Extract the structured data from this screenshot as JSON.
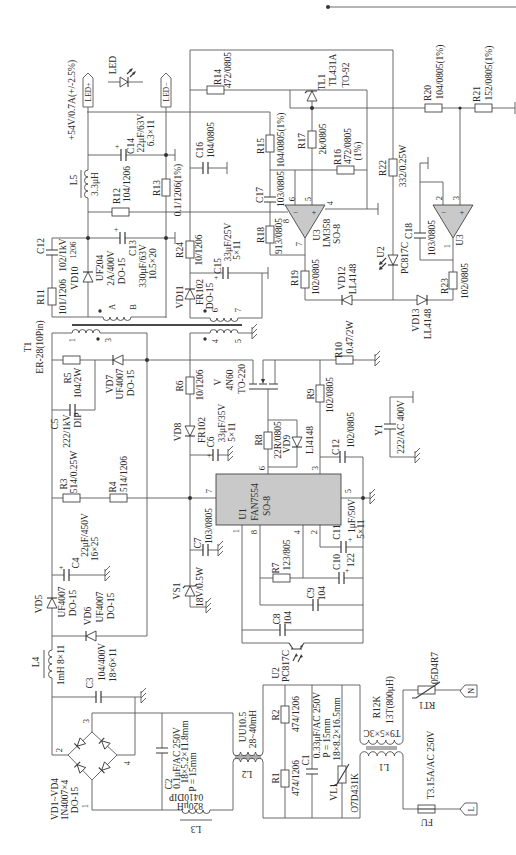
{
  "output": {
    "voltage_spec": "+54V/0.7A(+/-2.5%)",
    "led_plus": "LED+",
    "led_minus": "LED−",
    "led": "LED"
  },
  "components": {
    "R14": {
      "ref": "R14",
      "value": "472/0805"
    },
    "TL1": {
      "ref": "TL1",
      "part": "TL431A",
      "package": "TO-92"
    },
    "R20": {
      "ref": "R20",
      "value": "104/0805(1%)"
    },
    "R21": {
      "ref": "R21",
      "value": "152/0805(1%)"
    },
    "C14": {
      "ref": "C14",
      "value": "22μF/63V",
      "size": "6.3×11",
      "polarity": "+"
    },
    "C16": {
      "ref": "C16",
      "value": "104/0805"
    },
    "L5": {
      "ref": "L5",
      "value": "3.3μH"
    },
    "R12": {
      "ref": "R12",
      "value": "104/1206"
    },
    "R13": {
      "ref": "R13",
      "value": "0.1/1206(1%)"
    },
    "R15": {
      "ref": "R15",
      "value": "104/0805(1%)"
    },
    "R17": {
      "ref": "R17",
      "value": "2k/0805"
    },
    "R16": {
      "ref": "R16",
      "value": "472/0805",
      "tolerance": "(1%)"
    },
    "R22": {
      "ref": "R22",
      "value": "332/0.25W"
    },
    "C17": {
      "ref": "C17",
      "value": "103/0805"
    },
    "U3A": {
      "ref": "U3",
      "part": "LM358",
      "package": "SO-8",
      "minus": "−",
      "plus": "+",
      "pins": {
        "p4": "4",
        "p5": "5",
        "p6": "6",
        "p7": "7",
        "p8": "8"
      }
    },
    "U3B": {
      "ref": "U3",
      "minus": "−",
      "plus": "+",
      "pins": {
        "p1": "1",
        "p2": "2",
        "p3": "3"
      }
    },
    "R18": {
      "ref": "R18",
      "value": "913/0805"
    },
    "R19": {
      "ref": "R19",
      "value": "102/0805"
    },
    "VD12": {
      "ref": "VD12",
      "part": "LL4148"
    },
    "VD13": {
      "ref": "VD13",
      "part": "LL4148"
    },
    "U2A": {
      "ref": "U2",
      "part": "PC817C"
    },
    "C18": {
      "ref": "C18",
      "value": "103/0805"
    },
    "R23": {
      "ref": "R23",
      "value": "102/0805"
    },
    "R10": {
      "ref": "R10",
      "value": "0.47/2W"
    },
    "R24": {
      "ref": "R24",
      "value": "10/1206"
    },
    "C15": {
      "ref": "C15",
      "value": "33μF/25V",
      "size": "5×11",
      "polarity": "+"
    },
    "VD11": {
      "ref": "VD11",
      "part": "FR102",
      "package": "DO-15"
    },
    "C12A": {
      "ref": "C12",
      "value": "102/1kV"
    },
    "R11": {
      "ref": "R11",
      "value": "101/1206"
    },
    "VD10": {
      "ref": "VD10",
      "note": "1206",
      "part": "UF204",
      "rating": "2A/400V",
      "package": "DO-15"
    },
    "C13": {
      "ref": "C13",
      "value": "330μF/63V",
      "size": "10.5×20",
      "polarity": "+"
    },
    "T1": {
      "ref": "T1",
      "part": "ER-28(10Pin)",
      "pins": {
        "A": "A",
        "B": "B",
        "p1": "1",
        "p3": "3",
        "p4": "4",
        "p5": "5",
        "p6": "6",
        "p7": "7"
      }
    },
    "R5": {
      "ref": "R5",
      "value": "104/2W"
    },
    "VD7": {
      "ref": "VD7",
      "part": "UF4007",
      "package": "DO-15"
    },
    "C5": {
      "ref": "C5",
      "value": "222/1kV",
      "package": "DIP"
    },
    "R6": {
      "ref": "R6",
      "value": "10/1206"
    },
    "V": {
      "ref": "V",
      "part": "4N60",
      "package": "TO-220"
    },
    "R3": {
      "ref": "R3",
      "value": "514/0.25W"
    },
    "R4": {
      "ref": "R4",
      "value": "514/1206"
    },
    "VD8": {
      "ref": "VD8",
      "part": "FR102"
    },
    "C6": {
      "ref": "C6",
      "value": "33μF/35V",
      "size": "5×11",
      "polarity": "+"
    },
    "R9": {
      "ref": "R9",
      "value": "102/0805"
    },
    "R8": {
      "ref": "R8",
      "value": "22R/0805"
    },
    "VD9": {
      "ref": "VD9",
      "part": "LI4148"
    },
    "C12B": {
      "ref": "C12",
      "value": "102/0805"
    },
    "Y1": {
      "ref": "Y1",
      "value": "222/AC 400V"
    },
    "U1": {
      "ref": "U1",
      "part": "FAN7554",
      "package": "SO-8",
      "pins": {
        "p1": "1",
        "p2": "2",
        "p3": "3",
        "p4": "4",
        "p5": "5",
        "p6": "6",
        "p7": "7",
        "p8": "8"
      }
    },
    "C4": {
      "ref": "C4",
      "value": "22μF/450V",
      "size": "16×25",
      "polarity": "+"
    },
    "C7": {
      "ref": "C7",
      "value": "103/0805"
    },
    "VS1": {
      "ref": "VS1",
      "value": "18V/0.5W"
    },
    "R7": {
      "ref": "R7",
      "value": "123/805"
    },
    "C10": {
      "ref": "C10",
      "value": "122",
      "polarity": "+"
    },
    "C11": {
      "ref": "C11",
      "value": "1μF/50V",
      "size": "5×11",
      "polarity": "+"
    },
    "C9": {
      "ref": "C9",
      "value": "104"
    },
    "C8": {
      "ref": "C8",
      "value": "104"
    },
    "U2B": {
      "ref": "U2",
      "part": "PC817C"
    },
    "VD5": {
      "ref": "VD5",
      "part": "UF4007",
      "package": "DO-15"
    },
    "VD6": {
      "ref": "VD6",
      "part": "UF4007",
      "package": "DO-15"
    },
    "L4": {
      "ref": "L4",
      "value": "1mH 8×11"
    },
    "C3": {
      "ref": "C3",
      "value": "104/400V",
      "size": "18×6×11"
    },
    "BRIDGE": {
      "ref": "VD1~VD4",
      "part": "1N4007×4",
      "package": "DO-15",
      "pins": {
        "p1": "1",
        "p2": "2",
        "p3": "3",
        "p4": "4"
      }
    },
    "C2": {
      "ref": "C2",
      "value": "0.1μF/AC 250V",
      "size": "18×5.2×11.8mm",
      "pitch": "P = 15mm"
    },
    "L3": {
      "ref": "L3",
      "value": "820μH",
      "part": "0410DIP"
    },
    "L2": {
      "ref": "L2",
      "part": "UU10.5",
      "value": "28~40mH"
    },
    "R2": {
      "ref": "R2",
      "value": "474/1206"
    },
    "R1": {
      "ref": "R1",
      "value": "474/1206"
    },
    "C1": {
      "ref": "C1",
      "value": "0.33μF/AC 250V",
      "pitch": "P = 15mm",
      "size": "18×8.2×16.5mm"
    },
    "VL1": {
      "ref": "VL1",
      "part": "O7D431K"
    },
    "L1": {
      "ref": "L1",
      "part": "R12K",
      "value": "13T(800μH)",
      "core": "T9×5×3C"
    },
    "RT1": {
      "ref": "RT1",
      "value": "05D4R7"
    },
    "FU": {
      "ref": "FU",
      "value": "T3.15A/AC 250V"
    }
  },
  "connectors": {
    "N": "N",
    "L": "L"
  }
}
